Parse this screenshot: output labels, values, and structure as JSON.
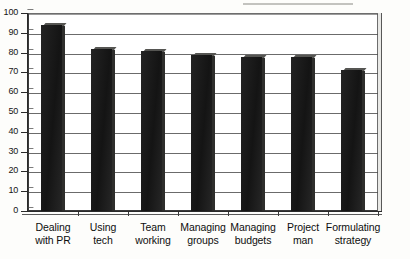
{
  "chart_data": {
    "type": "bar",
    "title": "",
    "subtitle": "",
    "xlabel": "",
    "ylabel": "",
    "categories": [
      "Dealing with PR",
      "Using tech",
      "Team working",
      "Managing groups",
      "Managing budgets",
      "Project man",
      "Formulating strategy"
    ],
    "category_lines": [
      [
        "Dealing",
        "with PR"
      ],
      [
        "Using",
        "tech"
      ],
      [
        "Team",
        "working"
      ],
      [
        "Managing",
        "groups"
      ],
      [
        "Managing",
        "budgets"
      ],
      [
        "Project",
        "man"
      ],
      [
        "Formulating",
        "strategy"
      ]
    ],
    "values": [
      95,
      83,
      82,
      80,
      79,
      79,
      72
    ],
    "ylim": [
      0,
      100
    ],
    "ytick_labels": [
      "100",
      "90",
      "80",
      "70",
      "60",
      "50",
      "40",
      "30",
      "20",
      "10",
      "0"
    ],
    "ytick_values": [
      100,
      90,
      80,
      70,
      60,
      50,
      40,
      30,
      20,
      10,
      0
    ],
    "grid": true,
    "legend": false,
    "legend_position": "none",
    "style": "3d-column",
    "colors": {
      "bar": "#1b1b1b",
      "bar_top": "#555552",
      "bar_side": "#2e2e2c",
      "gridline": "#4a4a4a",
      "axis": "#2a2a2a",
      "plot_background": "#ffffff",
      "page_background": "#fdfdfb",
      "text": "#0e0e0e"
    }
  }
}
